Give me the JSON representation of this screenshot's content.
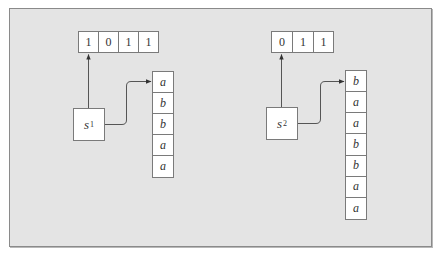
{
  "diagram": {
    "structures": [
      {
        "node": {
          "label": "s",
          "subscript": "1"
        },
        "bit_array": [
          "1",
          "0",
          "1",
          "1"
        ],
        "string_column": [
          "a",
          "b",
          "b",
          "a",
          "a"
        ]
      },
      {
        "node": {
          "label": "s",
          "subscript": "2"
        },
        "bit_array": [
          "0",
          "1",
          "1"
        ],
        "string_column": [
          "b",
          "a",
          "a",
          "b",
          "b",
          "a",
          "a"
        ]
      }
    ],
    "colors": {
      "background": "#e4e4e4",
      "box_fill": "#ffffff",
      "stroke": "#6e6e6e"
    }
  }
}
